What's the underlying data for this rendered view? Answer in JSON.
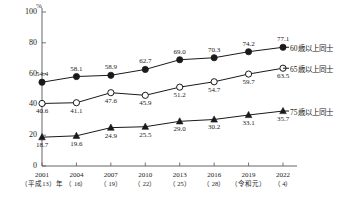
{
  "chart_data": {
    "type": "line",
    "title": "",
    "xlabel": "",
    "ylabel": "",
    "unit": "%",
    "ylim": [
      0,
      100
    ],
    "yticks": [
      "0",
      "20",
      "40",
      "60",
      "80",
      "100"
    ],
    "grid": false,
    "legend_position": "right",
    "categories": [
      "2001",
      "2004",
      "2007",
      "2010",
      "2013",
      "2016",
      "2019",
      "2022"
    ],
    "category_sublabels": [
      "（平成13）年",
      "（ 16）",
      "（ 19）",
      "（ 22）",
      "（ 25）",
      "（ 28）",
      "（令和元）",
      "（ 4）"
    ],
    "series": [
      {
        "name": "60歳以上同士",
        "marker": "filled-circle",
        "values": [
          54.4,
          58.1,
          58.9,
          62.7,
          69.0,
          70.3,
          74.2,
          77.1
        ],
        "labels": [
          "54.4",
          "58.1",
          "58.9",
          "62.7",
          "69.0",
          "70.3",
          "74.2",
          "77.1"
        ]
      },
      {
        "name": "65歳以上同士",
        "marker": "open-circle",
        "values": [
          40.6,
          41.1,
          47.6,
          45.9,
          51.2,
          54.7,
          59.7,
          63.5
        ],
        "labels": [
          "40.6",
          "41.1",
          "47.6",
          "45.9",
          "51.2",
          "54.7",
          "59.7",
          "63.5"
        ]
      },
      {
        "name": "75歳以上同士",
        "marker": "filled-triangle",
        "values": [
          18.7,
          19.6,
          24.9,
          25.5,
          29.0,
          30.2,
          33.1,
          35.7
        ],
        "labels": [
          "18.7",
          "19.6",
          "24.9",
          "25.5",
          "29.0",
          "30.2",
          "33.1",
          "35.7"
        ]
      }
    ],
    "colors": {
      "line": "#1a1a1a",
      "axis": "#555555",
      "text": "#222222",
      "background": "#ffffff"
    }
  }
}
